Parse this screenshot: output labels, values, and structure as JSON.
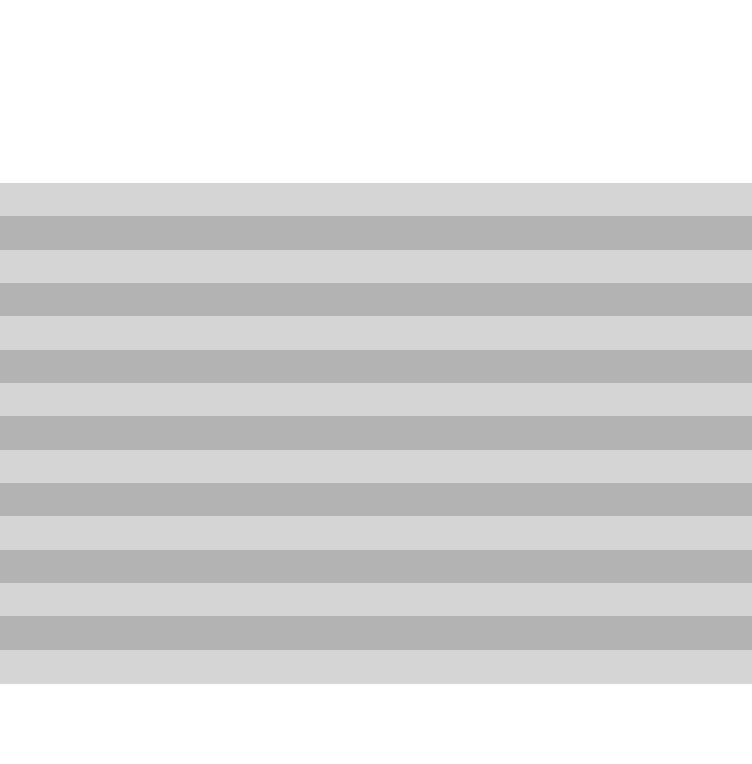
{
  "image": {
    "description": "Gray and light-gray horizontal striped sheet on white background",
    "background": "#ffffff",
    "colors": {
      "light": "#d5d5d5",
      "dark": "#b3b3b3"
    },
    "stripes": [
      "light",
      "dark",
      "light",
      "dark",
      "light",
      "dark",
      "light",
      "dark",
      "light",
      "dark",
      "light",
      "dark",
      "light",
      "dark",
      "light"
    ]
  }
}
